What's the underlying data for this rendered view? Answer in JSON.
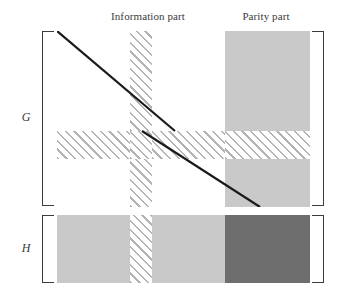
{
  "figure": {
    "type": "diagram",
    "background_color": "#ffffff"
  },
  "captions": {
    "information": "Information part",
    "parity": "Parity part"
  },
  "row_labels": {
    "generator": "G",
    "parity_check": "H"
  },
  "colors": {
    "light_gray": "#c9c9c9",
    "dark_gray": "#6e6e6e",
    "hatch_line": "#b4b4b4",
    "bracket": "#3c3c3c",
    "diagonal_line": "#1a1a1a",
    "white": "#ffffff"
  },
  "blocks": {
    "g_row_top": [
      {
        "name": "g-info-left-top",
        "fill": "white"
      },
      {
        "name": "g-hatch-column-top",
        "fill": "hatch"
      },
      {
        "name": "g-info-right-top",
        "fill": "white"
      },
      {
        "name": "g-parity-top",
        "fill": "light_gray"
      }
    ],
    "g_row_middle": [
      {
        "name": "g-hatch-band-left",
        "fill": "hatch"
      },
      {
        "name": "g-hatch-band-center",
        "fill": "hatch"
      },
      {
        "name": "g-hatch-band-right",
        "fill": "hatch"
      },
      {
        "name": "g-hatch-band-parity",
        "fill": "hatch"
      }
    ],
    "g_row_bottom": [
      {
        "name": "g-info-left-bottom",
        "fill": "white"
      },
      {
        "name": "g-hatch-column-bottom",
        "fill": "hatch"
      },
      {
        "name": "g-info-right-bottom",
        "fill": "white"
      },
      {
        "name": "g-parity-bottom",
        "fill": "light_gray"
      }
    ],
    "h_row": [
      {
        "name": "h-info-left",
        "fill": "light_gray"
      },
      {
        "name": "h-hatch-column",
        "fill": "hatch"
      },
      {
        "name": "h-info-right",
        "fill": "light_gray"
      },
      {
        "name": "h-parity",
        "fill": "dark_gray"
      }
    ]
  },
  "diagonals": [
    {
      "name": "upper-diagonal",
      "from": [
        0,
        0
      ],
      "to": [
        118,
        100
      ]
    },
    {
      "name": "lower-diagonal",
      "from": [
        85,
        100
      ],
      "to": [
        203,
        176
      ]
    }
  ]
}
